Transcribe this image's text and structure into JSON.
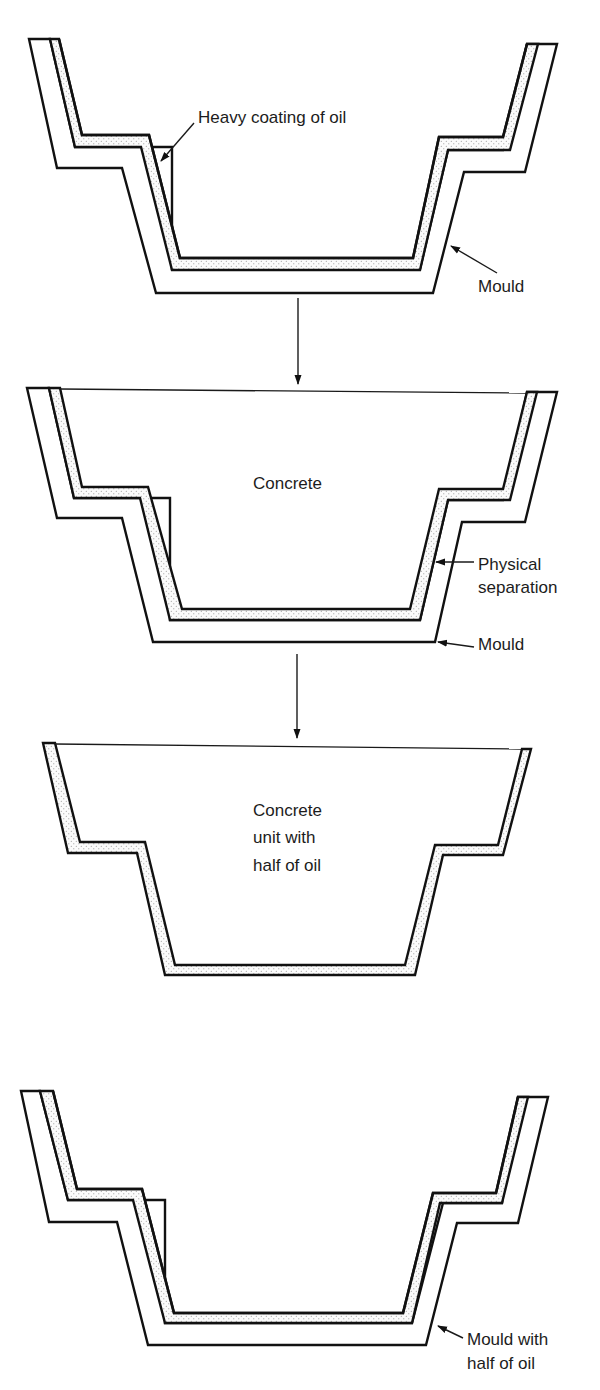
{
  "figure": {
    "type": "process-diagram",
    "colors": {
      "line": "#111111",
      "background": "#ffffff",
      "oil_dots": "#8a8a8a"
    },
    "stages": [
      {
        "id": 1,
        "description": "Empty mould coated with oil",
        "labels": {
          "coating": "Heavy coating of oil",
          "mould": "Mould"
        }
      },
      {
        "id": 2,
        "description": "Concrete cast in oiled mould",
        "labels": {
          "fill": "Concrete",
          "separation_1": "Physical",
          "separation_2": "separation",
          "mould": "Mould"
        }
      },
      {
        "id": 3,
        "description": "De-moulded concrete unit",
        "labels": {
          "line1": "Concrete",
          "line2": "unit with",
          "line3": "half of oil"
        }
      },
      {
        "id": 4,
        "description": "Mould after de-moulding",
        "labels": {
          "line1": "Mould with",
          "line2": "half of oil"
        }
      }
    ],
    "arrows": [
      {
        "from_stage": 1,
        "to_stage": 2,
        "icon": "down-arrow-icon"
      },
      {
        "from_stage": 2,
        "to_stage": 3,
        "icon": "down-arrow-icon"
      }
    ]
  }
}
